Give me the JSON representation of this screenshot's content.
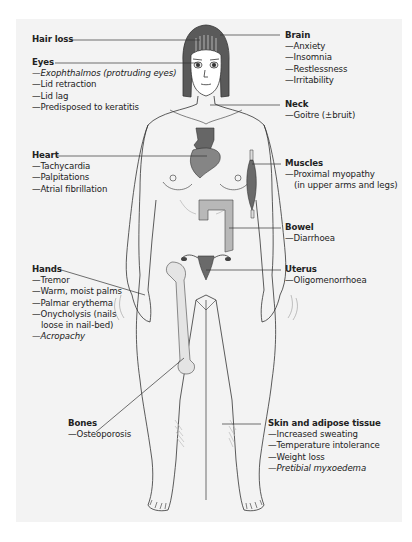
{
  "diagram": {
    "background_panel_color": "#f3f3f3",
    "organ_color": "#7a7a7a",
    "bone_color": "#e4e4e4",
    "bowel_color": "#b8b8b8",
    "labels": {
      "hair": {
        "heading": "Hair loss",
        "items": []
      },
      "eyes": {
        "heading": "Eyes",
        "items": [
          {
            "text": "—Exophthalmos (protruding eyes)",
            "italic": true
          },
          {
            "text": "—Lid retraction",
            "italic": false
          },
          {
            "text": "—Lid lag",
            "italic": false
          },
          {
            "text": "—Predisposed to keratitis",
            "italic": false
          }
        ]
      },
      "heart": {
        "heading": "Heart",
        "items": [
          {
            "text": "—Tachycardia",
            "italic": false
          },
          {
            "text": "—Palpitations",
            "italic": false
          },
          {
            "text": "—Atrial fibrillation",
            "italic": false
          }
        ]
      },
      "hands": {
        "heading": "Hands",
        "items": [
          {
            "text": "—Tremor",
            "italic": false
          },
          {
            "text": "—Warm, moist palms",
            "italic": false
          },
          {
            "text": "—Palmar erythema",
            "italic": false
          },
          {
            "text": "—Onycholysis (nails",
            "italic": false
          },
          {
            "text": "loose in nail-bed)",
            "italic": false,
            "continuation": true
          },
          {
            "text": "—Acropachy",
            "italic": true
          }
        ]
      },
      "bones": {
        "heading": "Bones",
        "items": [
          {
            "text": "—Osteoporosis",
            "italic": false
          }
        ]
      },
      "brain": {
        "heading": "Brain",
        "items": [
          {
            "text": "—Anxiety",
            "italic": false
          },
          {
            "text": "—Insomnia",
            "italic": false
          },
          {
            "text": "—Restlessness",
            "italic": false
          },
          {
            "text": "—Irritability",
            "italic": false
          }
        ]
      },
      "neck": {
        "heading": "Neck",
        "items": [
          {
            "text": "—Goitre (±bruit)",
            "italic": false
          }
        ]
      },
      "muscles": {
        "heading": "Muscles",
        "items": [
          {
            "text": "—Proximal myopathy",
            "italic": false
          },
          {
            "text": "(in upper arms and legs)",
            "italic": false,
            "continuation": true
          }
        ]
      },
      "bowel": {
        "heading": "Bowel",
        "items": [
          {
            "text": "—Diarrhoea",
            "italic": false
          }
        ]
      },
      "uterus": {
        "heading": "Uterus",
        "items": [
          {
            "text": "—Oligomenorrhoea",
            "italic": false
          }
        ]
      },
      "skin": {
        "heading": "Skin and adipose tissue",
        "items": [
          {
            "text": "—Increased sweating",
            "italic": false
          },
          {
            "text": "—Temperature intolerance",
            "italic": false
          },
          {
            "text": "—Weight loss",
            "italic": false
          },
          {
            "text": "—Pretibial myxoedema",
            "italic": true
          }
        ]
      }
    }
  }
}
